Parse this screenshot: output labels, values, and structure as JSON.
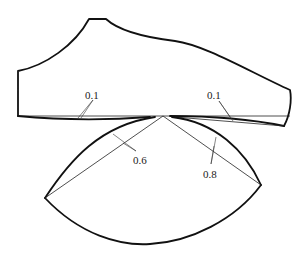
{
  "diagram": {
    "colors": {
      "stroke": "#111111",
      "background": "#ffffff"
    },
    "labels": {
      "left_bottom_allowance": "0.1",
      "right_bottom_allowance": "0.1",
      "sector_left_allowance": "0.6",
      "sector_right_allowance": "0.8"
    }
  }
}
